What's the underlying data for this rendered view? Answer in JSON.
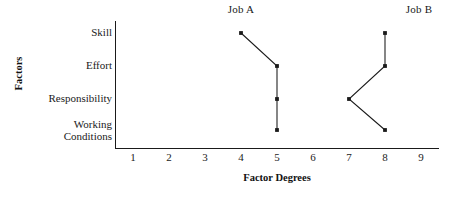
{
  "chart_data": {
    "type": "line",
    "title": "",
    "xlabel": "Factor Degrees",
    "ylabel": "Factors",
    "categories": [
      "Skill",
      "Effort",
      "Responsibility",
      "Working\nConditions"
    ],
    "category_plain": [
      "Skill",
      "Effort",
      "Responsibility",
      "Working Conditions"
    ],
    "x_ticks": [
      1,
      2,
      3,
      4,
      5,
      6,
      7,
      8,
      9
    ],
    "xlim": [
      0.5,
      9.5
    ],
    "grid": false,
    "legend_position": "top-inline-column-headers",
    "series": [
      {
        "name": "Job A",
        "header_label": "Job A",
        "values": [
          4,
          5,
          5,
          5
        ],
        "points": [
          {
            "category": "Skill",
            "x": 4
          },
          {
            "category": "Effort",
            "x": 5
          },
          {
            "category": "Responsibility",
            "x": 5
          },
          {
            "category": "Working Conditions",
            "x": 5
          }
        ]
      },
      {
        "name": "Job B",
        "header_label": "Job B",
        "values": [
          8,
          8,
          7,
          8
        ],
        "points": [
          {
            "category": "Skill",
            "x": 8
          },
          {
            "category": "Effort",
            "x": 8
          },
          {
            "category": "Responsibility",
            "x": 7
          },
          {
            "category": "Working Conditions",
            "x": 8
          }
        ]
      }
    ],
    "colors": {
      "line": "#1a1a1a",
      "marker": "#1a1a1a",
      "axis": "#1a1a1a",
      "background": "#ffffff"
    }
  },
  "headers": {
    "job_a": "Job A",
    "job_b": "Job B"
  },
  "axes": {
    "y_title": "Factors",
    "x_title": "Factor Degrees",
    "x_tick_labels": [
      "1",
      "2",
      "3",
      "4",
      "5",
      "6",
      "7",
      "8",
      "9"
    ]
  },
  "categories": {
    "skill": "Skill",
    "effort": "Effort",
    "responsibility": "Responsibility",
    "working_conditions": "Working\nConditions"
  }
}
